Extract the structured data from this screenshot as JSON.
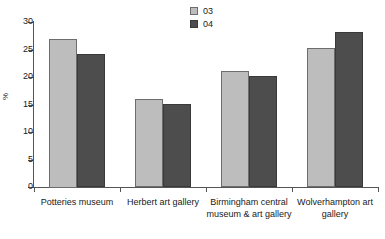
{
  "chart_data": {
    "type": "bar",
    "title": "",
    "xlabel": "",
    "ylabel": "%",
    "ylim": [
      0,
      30
    ],
    "ytick_step": 5,
    "ytick_labels": [
      "0",
      "5",
      "10",
      "15",
      "20",
      "25",
      "30"
    ],
    "grid": false,
    "legend_position": "top-center",
    "categories": [
      "Potteries museum",
      "Herbert art gallery",
      "Birmingham central museum & art gallery",
      "Wolverhampton art gallery"
    ],
    "category_lines": [
      [
        "Potteries museum"
      ],
      [
        "Herbert art gallery"
      ],
      [
        "Birmingham central",
        "museum & art gallery"
      ],
      [
        "Wolverhampton art",
        "gallery"
      ]
    ],
    "series": [
      {
        "name": "03",
        "color": "#bdbdbd",
        "values": [
          27.0,
          16.0,
          21.1,
          25.2
        ]
      },
      {
        "name": "04",
        "color": "#4d4d4d",
        "values": [
          24.1,
          15.1,
          20.2,
          28.2
        ]
      }
    ]
  },
  "legend": {
    "items": [
      {
        "label": "03"
      },
      {
        "label": "04"
      }
    ]
  },
  "axis": {
    "y_title": "%"
  }
}
